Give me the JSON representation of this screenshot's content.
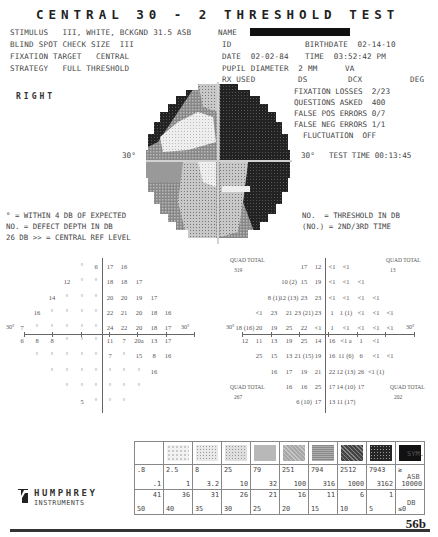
{
  "title": "CENTRAL 30 - 2 THRESHOLD TEST",
  "header": {
    "stimulus": "STIMULUS   III, WHITE, BCKGND 31.5 ASB",
    "name_label": "NAME",
    "blind_spot": "BLIND SPOT CHECK SIZE  III",
    "fixation_target": "FIXATION TARGET   CENTRAL",
    "strategy": "STRATEGY   FULL THRESHOLD",
    "id_label": "ID",
    "birthdate": "BIRTHDATE  02-14-10",
    "date": "DATE  02-02-84",
    "time": "TIME  03:52:42 PM",
    "pupil": "PUPIL DIAMETER  2 MM",
    "va": "VA",
    "rx_used": "RX USED",
    "ds": "DS",
    "dcx": "DCX",
    "deg": "DEG"
  },
  "eye": "RIGHT",
  "reliability": {
    "fixation_losses": "FIXATION LOSSES  2/23",
    "questions_asked": "QUESTIONS ASKED  400",
    "false_pos": "FALSE POS ERRORS 0/7",
    "false_neg": "FALSE NEG ERRORS 1/1",
    "fluctuation": "FLUCTUATION  OFF",
    "test_time": "TEST TIME 00:13:45"
  },
  "map_axis": {
    "left": "30°",
    "right": "30°"
  },
  "legend_left": {
    "line1": "° = WITHIN 4 DB OF EXPECTED",
    "line2": "NO. = DEFECT DEPTH IN DB",
    "line3": "26 DB >> = CENTRAL REF LEVEL"
  },
  "legend_right": {
    "line1": "NO.  = THRESHOLD IN DB",
    "line2": "(NO.) = 2ND/3RD TIME"
  },
  "defect_grid": {
    "axis_left": "30°",
    "axis_right": "30°",
    "rows": [
      {
        "y": 266,
        "cells": [
          [
            82,
            "°"
          ],
          [
            96,
            "6"
          ],
          [
            110,
            "17"
          ],
          [
            124,
            "16"
          ]
        ]
      },
      {
        "y": 281,
        "cells": [
          [
            67,
            "12"
          ],
          [
            82,
            "°"
          ],
          [
            96,
            "°"
          ],
          [
            110,
            "18"
          ],
          [
            124,
            "18"
          ],
          [
            139,
            "17"
          ]
        ]
      },
      {
        "y": 297,
        "cells": [
          [
            52,
            "14"
          ],
          [
            67,
            "°"
          ],
          [
            82,
            "°"
          ],
          [
            96,
            "°"
          ],
          [
            110,
            "20"
          ],
          [
            124,
            "20"
          ],
          [
            139,
            "19"
          ],
          [
            154,
            "17"
          ]
        ]
      },
      {
        "y": 312,
        "cells": [
          [
            37,
            "16"
          ],
          [
            52,
            "°"
          ],
          [
            67,
            "°"
          ],
          [
            82,
            "°"
          ],
          [
            96,
            "°"
          ],
          [
            110,
            "22"
          ],
          [
            124,
            "21"
          ],
          [
            139,
            "20"
          ],
          [
            154,
            "18"
          ],
          [
            168,
            "16"
          ]
        ]
      },
      {
        "y": 327,
        "cells": [
          [
            22,
            "7"
          ],
          [
            37,
            "°"
          ],
          [
            52,
            "°"
          ],
          [
            67,
            "°"
          ],
          [
            82,
            "°"
          ],
          [
            96,
            "°"
          ],
          [
            110,
            "24"
          ],
          [
            124,
            "22"
          ],
          [
            139,
            "20"
          ],
          [
            154,
            "18"
          ],
          [
            168,
            "17"
          ]
        ]
      },
      {
        "y": 340,
        "cells": [
          [
            22,
            "6"
          ],
          [
            37,
            "8"
          ],
          [
            52,
            "8"
          ],
          [
            67,
            "°"
          ],
          [
            82,
            "°"
          ],
          [
            96,
            "°"
          ],
          [
            110,
            "11"
          ],
          [
            124,
            "7"
          ],
          [
            139,
            "20a"
          ],
          [
            154,
            "13"
          ],
          [
            168,
            "17"
          ]
        ]
      },
      {
        "y": 355,
        "cells": [
          [
            37,
            "°"
          ],
          [
            52,
            "°"
          ],
          [
            67,
            "°"
          ],
          [
            82,
            "°"
          ],
          [
            96,
            "°"
          ],
          [
            110,
            "7"
          ],
          [
            124,
            "°"
          ],
          [
            139,
            "15"
          ],
          [
            154,
            "8"
          ],
          [
            168,
            "16"
          ]
        ]
      },
      {
        "y": 371,
        "cells": [
          [
            52,
            "°"
          ],
          [
            67,
            "°"
          ],
          [
            82,
            "°"
          ],
          [
            96,
            "°"
          ],
          [
            110,
            "°"
          ],
          [
            124,
            "°"
          ],
          [
            139,
            "°"
          ],
          [
            154,
            "16"
          ]
        ]
      },
      {
        "y": 386,
        "cells": [
          [
            67,
            "°"
          ],
          [
            82,
            "°"
          ],
          [
            96,
            "°"
          ],
          [
            110,
            "°"
          ],
          [
            124,
            "°"
          ],
          [
            139,
            "°"
          ]
        ]
      },
      {
        "y": 401,
        "cells": [
          [
            82,
            "5"
          ],
          [
            96,
            "°"
          ],
          [
            110,
            "°"
          ],
          [
            124,
            "°"
          ]
        ]
      }
    ]
  },
  "threshold_grid": {
    "axis_left": "30°",
    "axis_right": "30°",
    "quad_totals": [
      {
        "label": "QUAD TOTAL",
        "value": "319",
        "x": 230,
        "y": 263
      },
      {
        "label": "QUAD TOTAL",
        "value": "13",
        "x": 386,
        "y": 263
      },
      {
        "label": "QUAD TOTAL",
        "value": "267",
        "x": 230,
        "y": 390
      },
      {
        "label": "QUAD TOTAL",
        "value": "202",
        "x": 390,
        "y": 390
      }
    ],
    "rows": [
      {
        "y": 266,
        "cells": [
          [
            304,
            "17"
          ],
          [
            318,
            "12"
          ],
          [
            332,
            "<1"
          ],
          [
            346,
            "<1"
          ]
        ]
      },
      {
        "y": 281,
        "cells": [
          [
            289,
            "10 (2)"
          ],
          [
            304,
            "15"
          ],
          [
            318,
            "19"
          ],
          [
            332,
            "<1"
          ],
          [
            346,
            "<1"
          ],
          [
            361,
            "<1"
          ]
        ]
      },
      {
        "y": 297,
        "cells": [
          [
            274,
            "8 (1)"
          ],
          [
            289,
            "12 (13)"
          ],
          [
            304,
            "23"
          ],
          [
            318,
            "23"
          ],
          [
            332,
            "<1"
          ],
          [
            346,
            "<1"
          ],
          [
            361,
            "<1"
          ],
          [
            376,
            "<1"
          ]
        ]
      },
      {
        "y": 312,
        "cells": [
          [
            259,
            "<1"
          ],
          [
            274,
            "23"
          ],
          [
            289,
            "21"
          ],
          [
            304,
            "23 (21)"
          ],
          [
            318,
            "23"
          ],
          [
            332,
            "1"
          ],
          [
            346,
            "1 (1)"
          ],
          [
            361,
            "<1"
          ],
          [
            376,
            "<1"
          ],
          [
            390,
            "<1"
          ]
        ]
      },
      {
        "y": 327,
        "cells": [
          [
            245,
            "18 (16)"
          ],
          [
            259,
            "20"
          ],
          [
            274,
            "19"
          ],
          [
            289,
            "25"
          ],
          [
            304,
            "22"
          ],
          [
            318,
            "<1"
          ],
          [
            332,
            "1"
          ],
          [
            346,
            "<1"
          ],
          [
            361,
            "<1"
          ],
          [
            376,
            "<1"
          ],
          [
            390,
            "<1"
          ]
        ]
      },
      {
        "y": 340,
        "cells": [
          [
            245,
            "12"
          ],
          [
            259,
            "11"
          ],
          [
            274,
            "13"
          ],
          [
            289,
            "19"
          ],
          [
            304,
            "25"
          ],
          [
            318,
            "14"
          ],
          [
            332,
            "16"
          ],
          [
            346,
            "<1 a"
          ],
          [
            361,
            "1"
          ],
          [
            376,
            "<1"
          ]
        ]
      },
      {
        "y": 355,
        "cells": [
          [
            259,
            "25"
          ],
          [
            274,
            "15"
          ],
          [
            289,
            "13"
          ],
          [
            304,
            "21 (15)"
          ],
          [
            318,
            "19"
          ],
          [
            332,
            "16"
          ],
          [
            346,
            "11 (6)"
          ],
          [
            361,
            "6"
          ],
          [
            376,
            "<1"
          ],
          [
            390,
            "<1"
          ]
        ]
      },
      {
        "y": 371,
        "cells": [
          [
            274,
            "16"
          ],
          [
            289,
            "17"
          ],
          [
            304,
            "19"
          ],
          [
            318,
            "21"
          ],
          [
            332,
            "22"
          ],
          [
            346,
            "12 (13)"
          ],
          [
            361,
            "26"
          ],
          [
            376,
            "<1 (1)"
          ]
        ]
      },
      {
        "y": 386,
        "cells": [
          [
            289,
            "16"
          ],
          [
            304,
            "16"
          ],
          [
            318,
            "25"
          ],
          [
            332,
            "17"
          ],
          [
            346,
            "14 (10)"
          ],
          [
            361,
            "17"
          ]
        ]
      },
      {
        "y": 401,
        "cells": [
          [
            304,
            "6 (10)"
          ],
          [
            318,
            "17"
          ],
          [
            332,
            "13"
          ],
          [
            346,
            "11 (17)"
          ]
        ]
      }
    ]
  },
  "gray_legend": {
    "row_labels": {
      "sym": "SYM.",
      "asb": "ASB",
      "db": "DB"
    },
    "columns": [
      {
        "shade": "#ffffff",
        "pattern": "none",
        "asb_top": ".8",
        "asb_bot": ".1",
        "db_top": "41",
        "db_bot": "50"
      },
      {
        "shade": "#f2f2f2",
        "pattern": "sparse-dots",
        "asb_top": "2.5",
        "asb_bot": "1",
        "db_top": "36",
        "db_bot": "40"
      },
      {
        "shade": "#e8e8e8",
        "pattern": "dots",
        "asb_top": "8",
        "asb_bot": "3.2",
        "db_top": "31",
        "db_bot": "35"
      },
      {
        "shade": "#dedede",
        "pattern": "grid",
        "asb_top": "25",
        "asb_bot": "10",
        "db_top": "26",
        "db_bot": "30"
      },
      {
        "shade": "#d2d2d2",
        "pattern": "dense-dots",
        "asb_top": "79",
        "asb_bot": "32",
        "db_top": "21",
        "db_bot": "25"
      },
      {
        "shade": "#a8a8a8",
        "pattern": "checker",
        "asb_top": "251",
        "asb_bot": "100",
        "db_top": "16",
        "db_bot": "20"
      },
      {
        "shade": "#8a8a8a",
        "pattern": "lines",
        "asb_top": "794",
        "asb_bot": "316",
        "db_top": "11",
        "db_bot": "15"
      },
      {
        "shade": "#444444",
        "pattern": "checker-dark",
        "asb_top": "2512",
        "asb_bot": "1000",
        "db_top": "6",
        "db_bot": "10"
      },
      {
        "shade": "#262626",
        "pattern": "dark-dots",
        "asb_top": "7943",
        "asb_bot": "3162",
        "db_top": "1",
        "db_bot": "5"
      },
      {
        "shade": "#111111",
        "pattern": "solid",
        "asb_top": "≥",
        "asb_bot": "10000",
        "db_top": "",
        "db_bot": "≤0"
      }
    ]
  },
  "brand": {
    "name": "HUMPHREY",
    "sub": "INSTRUMENTS"
  },
  "page_number": "56b"
}
